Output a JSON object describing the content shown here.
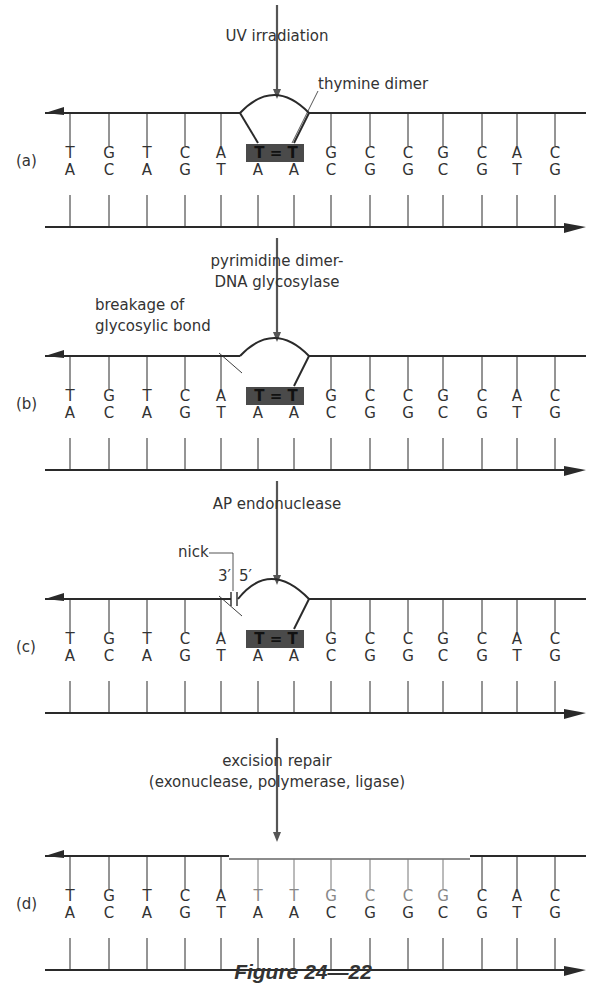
{
  "figure": {
    "caption": "Figure 24—22",
    "columns_x": [
      70,
      109,
      147,
      185,
      221,
      258,
      294,
      331,
      370,
      408,
      443,
      482,
      517,
      555
    ],
    "top_strand_bases": [
      "T",
      "G",
      "T",
      "C",
      "A",
      "T",
      "T",
      "G",
      "C",
      "C",
      "G",
      "C",
      "A",
      "C"
    ],
    "bottom_strand_bases": [
      "A",
      "C",
      "A",
      "G",
      "T",
      "A",
      "A",
      "C",
      "G",
      "G",
      "C",
      "G",
      "T",
      "G"
    ],
    "colors": {
      "ink": "#2a2a2a",
      "dimer_box": "#4a4a4a",
      "repaired": "#888888"
    }
  },
  "steps": [
    {
      "panel_label": "(a)",
      "y_top": 113,
      "arrow_label_lines": [
        "UV irradiation"
      ],
      "callout": "thymine dimer",
      "state": "dimer"
    },
    {
      "panel_label": "(b)",
      "y_top": 356,
      "arrow_label_lines": [
        "pyrimidine dimer-",
        "DNA glycosylase"
      ],
      "callout_lines": [
        "breakage of",
        "glycosylic bond"
      ],
      "state": "glycosylase"
    },
    {
      "panel_label": "(c)",
      "y_top": 599,
      "arrow_label_lines": [
        "AP endonuclease"
      ],
      "nick_label": "nick",
      "end_3": "3′",
      "end_5": "5′",
      "state": "nicked"
    },
    {
      "panel_label": "(d)",
      "y_top": 856,
      "arrow_label_lines": [
        "excision repair",
        "(exonuclease, polymerase, ligase)"
      ],
      "state": "repaired"
    }
  ],
  "dimer_label": "T = T"
}
